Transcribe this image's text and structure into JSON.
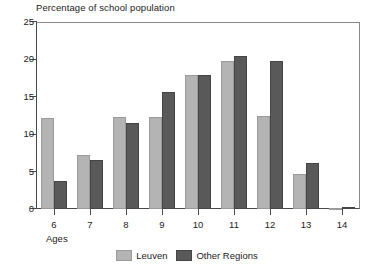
{
  "chart_data": {
    "type": "bar",
    "title": "Percentage of school population",
    "xlabel": "Ages",
    "ylabel": "",
    "categories": [
      "6",
      "7",
      "8",
      "9",
      "10",
      "11",
      "12",
      "13",
      "14"
    ],
    "series": [
      {
        "name": "Leuven",
        "color": "#b4b4b4",
        "values": [
          12.2,
          7.2,
          12.3,
          12.3,
          17.9,
          19.8,
          12.5,
          4.7,
          0.2
        ]
      },
      {
        "name": "Other Regions",
        "color": "#595959",
        "values": [
          3.7,
          6.5,
          11.5,
          15.7,
          17.9,
          20.5,
          19.8,
          6.2,
          0.3
        ]
      }
    ],
    "ylim": [
      0,
      25
    ],
    "yticks": [
      0,
      5,
      10,
      15,
      20,
      25
    ],
    "ytick_labels": [
      "0",
      "5",
      "10",
      "15",
      "20",
      "25"
    ],
    "grid": false,
    "legend_position": "bottom-center"
  }
}
